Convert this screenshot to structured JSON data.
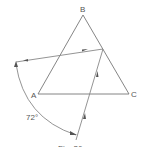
{
  "diagram": {
    "vertices": {
      "A": {
        "label": "A",
        "x": 38,
        "y": 94
      },
      "B": {
        "label": "B",
        "x": 83,
        "y": 15
      },
      "C": {
        "label": "C",
        "x": 129,
        "y": 94
      }
    },
    "angle_label": "72°",
    "caption": "Fig. 36",
    "colors": {
      "line": "#777777",
      "text": "#555555",
      "background": "#ffffff"
    }
  }
}
